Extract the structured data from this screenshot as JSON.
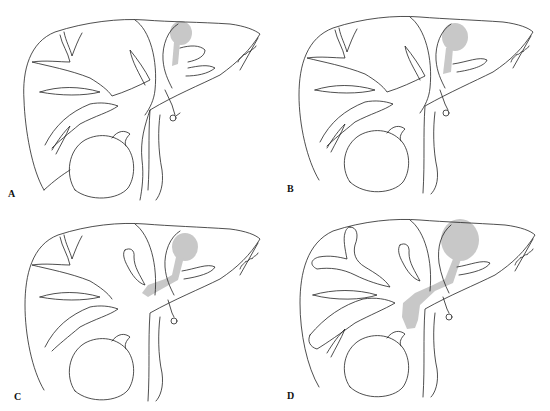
{
  "figure": {
    "layout": "2x2 grid",
    "panels": [
      {
        "id": "A",
        "label": "A",
        "lesion": "small cyst near hilum/left lobe with short narrow duct segment",
        "shade_color": "#c8c8c8"
      },
      {
        "id": "B",
        "label": "B",
        "lesion": "slightly larger cyst with short duct extension",
        "shade_color": "#c8c8c8"
      },
      {
        "id": "C",
        "label": "C",
        "lesion": "cyst with shaded duct extending to hepatic bifurcation",
        "shade_color": "#c8c8c8"
      },
      {
        "id": "D",
        "label": "D",
        "lesion": "large cyst with dilated duct extending into common bile duct region",
        "shade_color": "#c8c8c8"
      }
    ]
  }
}
